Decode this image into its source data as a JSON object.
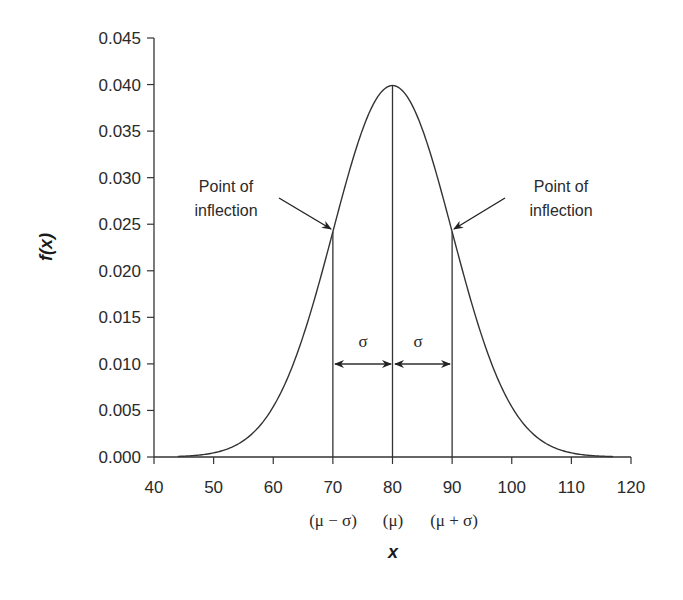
{
  "chart_data": {
    "type": "line",
    "title": "",
    "xlabel": "x",
    "ylabel": "f(x)",
    "xlim": [
      40,
      120
    ],
    "ylim": [
      0,
      0.045
    ],
    "grid": false,
    "legend": null,
    "x_ticks": [
      "40",
      "50",
      "60",
      "70",
      "80",
      "90",
      "100",
      "110",
      "120"
    ],
    "y_ticks": [
      "0.000",
      "0.005",
      "0.010",
      "0.015",
      "0.020",
      "0.025",
      "0.030",
      "0.035",
      "0.040",
      "0.045"
    ],
    "series": [
      {
        "name": "Normal density (mu=80, sigma=10)",
        "mu": 80,
        "sigma": 10,
        "x": [
          44,
          50,
          55,
          60,
          65,
          70,
          75,
          80,
          85,
          90,
          95,
          100,
          105,
          110,
          117
        ],
        "values": [
          0.0006,
          0.0044,
          0.0088,
          0.0054,
          0.013,
          0.0242,
          0.0352,
          0.0399,
          0.0352,
          0.0242,
          0.013,
          0.0054,
          0.0018,
          0.0044,
          0.0001
        ]
      }
    ],
    "annotations": [
      {
        "text": "Point of inflection",
        "x": 70,
        "y": 0.0242,
        "side": "left"
      },
      {
        "text": "Point of inflection",
        "x": 90,
        "y": 0.0242,
        "side": "right"
      },
      {
        "text": "σ",
        "from": 70,
        "to": 80
      },
      {
        "text": "σ",
        "from": 80,
        "to": 90
      }
    ],
    "secondary_x_labels": [
      {
        "x": 70,
        "text": "(μ − σ)"
      },
      {
        "x": 80,
        "text": "(μ)"
      },
      {
        "x": 90,
        "text": "(μ + σ)"
      }
    ]
  },
  "labels": {
    "ylabel": "f(x)",
    "ylabel_f": "f",
    "ylabel_x": "x",
    "xlabel": "x",
    "inflection_line1": "Point of",
    "inflection_line2": "inflection",
    "sigma": "σ",
    "mu_minus_sigma": "(μ − σ)",
    "mu": "(μ)",
    "mu_plus_sigma": "(μ + σ)"
  }
}
